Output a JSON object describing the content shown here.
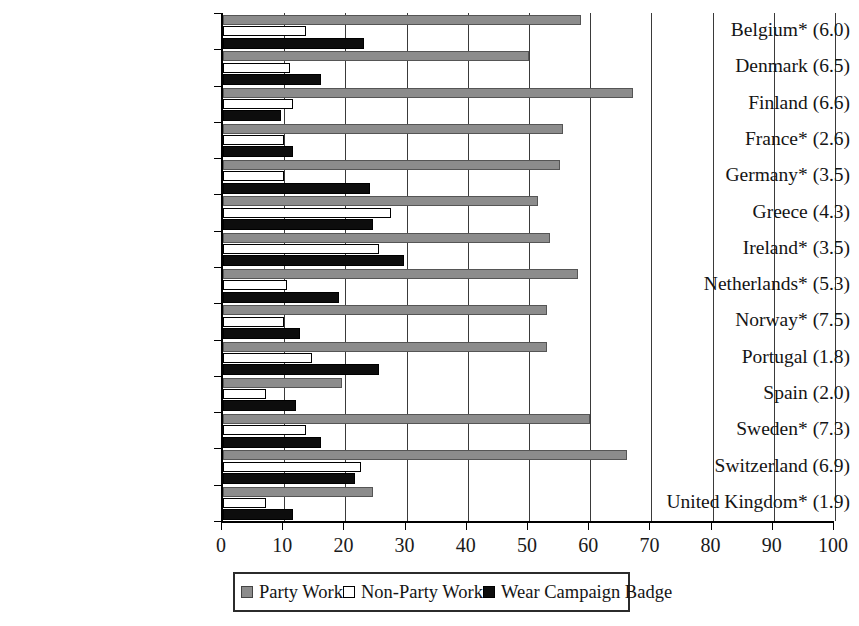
{
  "chart_data": {
    "type": "bar",
    "orientation": "horizontal",
    "title": "",
    "xlabel": "",
    "ylabel": "",
    "xlim": [
      0,
      100
    ],
    "xticks": [
      0,
      10,
      20,
      30,
      40,
      50,
      60,
      70,
      80,
      90,
      100
    ],
    "grid": "vertical gridlines at every 10 units",
    "legend_position": "bottom-center",
    "categories": [
      "Belgium* (6.0)",
      "Denmark (6.5)",
      "Finland (6.6)",
      "France* (2.6)",
      "Germany* (3.5)",
      "Greece (4.3)",
      "Ireland* (3.5)",
      "Netherlands* (5.3)",
      "Norway* (7.5)",
      "Portugal (1.8)",
      "Spain (2.0)",
      "Sweden* (7.3)",
      "Switzerland (6.9)",
      "United Kingdom* (1.9)"
    ],
    "series": [
      {
        "name": "Party Work",
        "color": "#8c8c8c",
        "values": [
          58.5,
          50.0,
          67.0,
          55.5,
          55.0,
          51.5,
          53.5,
          58.0,
          53.0,
          53.0,
          19.5,
          60.0,
          66.0,
          24.5
        ]
      },
      {
        "name": "Non-Party Work",
        "color": "#ffffff",
        "values": [
          13.5,
          11.0,
          11.5,
          10.0,
          10.0,
          27.5,
          25.5,
          10.5,
          10.0,
          14.5,
          7.0,
          13.5,
          22.5,
          7.0
        ]
      },
      {
        "name": "Wear Campaign Badge",
        "color": "#0d0d0d",
        "values": [
          23.0,
          16.0,
          9.5,
          11.5,
          24.0,
          24.5,
          29.5,
          19.0,
          12.5,
          25.5,
          12.0,
          16.0,
          21.5,
          11.5
        ]
      }
    ]
  },
  "legend": {
    "items": [
      {
        "label": "Party Work",
        "swatch": "party"
      },
      {
        "label": "Non-Party Work",
        "swatch": "nonparty"
      },
      {
        "label": "Wear Campaign Badge",
        "swatch": "badge"
      }
    ]
  },
  "axis": {
    "tick_labels": [
      "0",
      "10",
      "20",
      "30",
      "40",
      "50",
      "60",
      "70",
      "80",
      "90",
      "100"
    ]
  }
}
